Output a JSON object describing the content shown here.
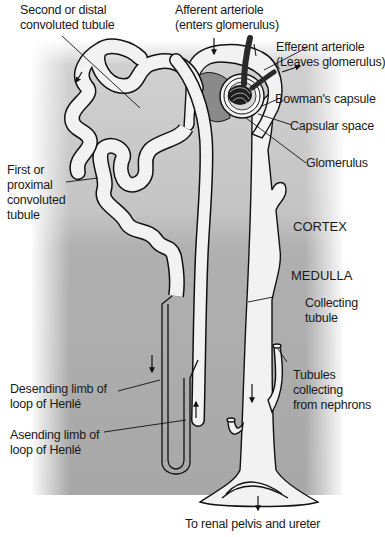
{
  "diagram": {
    "regions": {
      "cortex": "CORTEX",
      "medulla": "MEDULLA"
    },
    "labels": {
      "distal_tubule_1": "Second or distal",
      "distal_tubule_2": "convoluted tubule",
      "afferent_1": "Afferent arteriole",
      "afferent_2": "(enters glomerulus)",
      "efferent_1": "Efferent arteriole",
      "efferent_2": "(Leaves glomerulus)",
      "bowmans_capsule": "Bowman's capsule",
      "capsular_space": "Capsular space",
      "glomerulus": "Glomerulus",
      "proximal_1": "First or",
      "proximal_2": "proximal",
      "proximal_3": "convoluted",
      "proximal_4": "tubule",
      "collecting_1": "Collecting",
      "collecting_2": "tubule",
      "desc_limb_1": "Desending limb of",
      "desc_limb_2": "loop of Henlé",
      "asc_limb_1": "Asending limb of",
      "asc_limb_2": "loop of Henlé",
      "tubules_collecting_1": "Tubules",
      "tubules_collecting_2": "collecting",
      "tubules_collecting_3": "from nephrons",
      "renal_pelvis": "To renal pelvis and ureter"
    },
    "colors": {
      "cortex_bg": "#c4c4c4",
      "medulla_bg": "#a9a9a9",
      "tubule_fill": "#f2f2f2",
      "outline": "#111111",
      "arteriole": "#2a2a2a",
      "capsule_inner": "#8a8a8a"
    }
  }
}
